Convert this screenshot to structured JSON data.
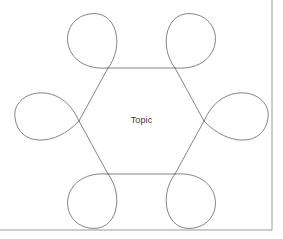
{
  "canvas": {
    "width": 283,
    "height": 239,
    "background_color": "#ffffff"
  },
  "diagram": {
    "kind": "hexagon-petal-loop-diagram",
    "title_label": "Topic",
    "line_color": "#767676",
    "line_width": 0.9,
    "frame": {
      "color": "#9a9a9a",
      "right_edge_x": 272,
      "bottom_edge_y": 230
    },
    "hexagon": {
      "center": {
        "x": 141.5,
        "y": 121
      },
      "vertices": [
        {
          "name": "top-left",
          "x": 108,
          "y": 68
        },
        {
          "name": "top-right",
          "x": 175,
          "y": 68
        },
        {
          "name": "right",
          "x": 204,
          "y": 121
        },
        {
          "name": "bottom-right",
          "x": 175,
          "y": 174
        },
        {
          "name": "bottom-left",
          "x": 108,
          "y": 174
        },
        {
          "name": "left",
          "x": 79,
          "y": 121
        }
      ]
    },
    "petals": [
      {
        "name": "petal-top-left",
        "path": "M 108 68 C 60 72 56 20 89 14 C 117 9 125 46 108 68 Z",
        "direction": "up-left"
      },
      {
        "name": "petal-top-right",
        "path": "M 175 68 C 223 72 227 20 194 14 C 166 9 158 46 175 68 Z",
        "direction": "up-right"
      },
      {
        "name": "petal-right",
        "path": "M 204 121 C 222 78 272 90 268 118 C 264 147 228 147 204 121 Z",
        "direction": "right"
      },
      {
        "name": "petal-bottom-right",
        "path": "M 175 174 C 223 170 227 222 194 228 C 166 233 158 196 175 174 Z",
        "direction": "down-right"
      },
      {
        "name": "petal-bottom-left",
        "path": "M 108 174 C 60 170 56 222 89 228 C 117 233 125 196 108 174 Z",
        "direction": "down-left"
      },
      {
        "name": "petal-left",
        "path": "M 79 121 C 61 78 11 90 15 118 C 19 147 55 147 79 121 Z",
        "direction": "left"
      }
    ],
    "hexagon_edges": [
      {
        "name": "edge-top",
        "x1": 108,
        "y1": 68,
        "x2": 175,
        "y2": 68
      },
      {
        "name": "edge-upper-right",
        "x1": 175,
        "y1": 68,
        "x2": 204,
        "y2": 121
      },
      {
        "name": "edge-lower-right",
        "x1": 204,
        "y1": 121,
        "x2": 175,
        "y2": 174
      },
      {
        "name": "edge-bottom",
        "x1": 175,
        "y1": 174,
        "x2": 108,
        "y2": 174
      },
      {
        "name": "edge-lower-left",
        "x1": 108,
        "y1": 174,
        "x2": 79,
        "y2": 121
      },
      {
        "name": "edge-upper-left",
        "x1": 79,
        "y1": 121,
        "x2": 108,
        "y2": 68
      }
    ]
  }
}
